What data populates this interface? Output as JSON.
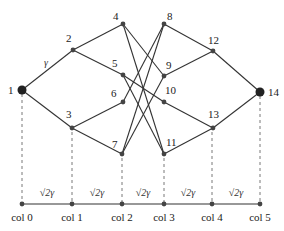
{
  "diagram": {
    "type": "graph",
    "colors": {
      "edge": "#333333",
      "node": "#444444",
      "terminal": "#222222",
      "guide": "#555555"
    },
    "nodes": [
      {
        "id": "1",
        "x": 22,
        "y": 90,
        "terminal": true,
        "lx": 8,
        "ly": 94
      },
      {
        "id": "2",
        "x": 73,
        "y": 50,
        "lx": 66,
        "ly": 42
      },
      {
        "id": "3",
        "x": 72,
        "y": 128,
        "lx": 66,
        "ly": 118
      },
      {
        "id": "4",
        "x": 123,
        "y": 24,
        "lx": 113,
        "ly": 20
      },
      {
        "id": "5",
        "x": 123,
        "y": 75,
        "lx": 112,
        "ly": 67
      },
      {
        "id": "6",
        "x": 123,
        "y": 102,
        "lx": 111,
        "ly": 97
      },
      {
        "id": "7",
        "x": 122,
        "y": 154,
        "lx": 112,
        "ly": 148
      },
      {
        "id": "8",
        "x": 164,
        "y": 24,
        "lx": 167,
        "ly": 20
      },
      {
        "id": "9",
        "x": 164,
        "y": 76,
        "lx": 166,
        "ly": 69
      },
      {
        "id": "10",
        "x": 164,
        "y": 102,
        "lx": 165,
        "ly": 94
      },
      {
        "id": "11",
        "x": 164,
        "y": 154,
        "lx": 166,
        "ly": 146
      },
      {
        "id": "12",
        "x": 213,
        "y": 51,
        "lx": 208,
        "ly": 44
      },
      {
        "id": "13",
        "x": 213,
        "y": 128,
        "lx": 208,
        "ly": 118
      },
      {
        "id": "14",
        "x": 260,
        "y": 92,
        "terminal": true,
        "lx": 268,
        "ly": 96
      }
    ],
    "edges": [
      [
        "1",
        "2"
      ],
      [
        "1",
        "3"
      ],
      [
        "2",
        "4"
      ],
      [
        "2",
        "5"
      ],
      [
        "3",
        "6"
      ],
      [
        "3",
        "7"
      ],
      [
        "4",
        "9"
      ],
      [
        "4",
        "11"
      ],
      [
        "5",
        "10"
      ],
      [
        "5",
        "11"
      ],
      [
        "6",
        "8"
      ],
      [
        "7",
        "8"
      ],
      [
        "7",
        "9"
      ],
      [
        "8",
        "12"
      ],
      [
        "9",
        "12"
      ],
      [
        "10",
        "13"
      ],
      [
        "11",
        "13"
      ],
      [
        "12",
        "14"
      ],
      [
        "13",
        "14"
      ]
    ],
    "edge_label": {
      "text": "γ",
      "x": 44,
      "y": 66
    },
    "axis": {
      "y": 204,
      "columns": [
        {
          "label": "col 0",
          "x": 22
        },
        {
          "label": "col 1",
          "x": 72
        },
        {
          "label": "col 2",
          "x": 122
        },
        {
          "label": "col 3",
          "x": 164
        },
        {
          "label": "col 4",
          "x": 212
        },
        {
          "label": "col 5",
          "x": 260
        }
      ],
      "spacing_labels": [
        "√2γ",
        "√2γ",
        "√2γ",
        "√2γ",
        "√2γ"
      ]
    }
  }
}
